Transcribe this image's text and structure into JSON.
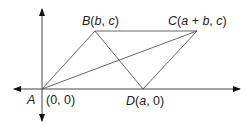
{
  "diagram": {
    "type": "coordinate-geometry",
    "points": {
      "A": {
        "name": "A",
        "coords": "(0, 0)"
      },
      "B": {
        "name": "B",
        "coords": "(b, c)"
      },
      "C": {
        "name": "C",
        "coords": "(a + b, c)"
      },
      "D": {
        "name": "D",
        "coords": "(a, 0)"
      }
    },
    "labels": {
      "A_letter": "A",
      "A_coords": "(0, 0)",
      "B_letter": "B",
      "B_open": "(",
      "B_b": "b",
      "B_sep": ", ",
      "B_c": "c",
      "B_close": ")",
      "C_letter": "C",
      "C_open": "(",
      "C_a": "a",
      "C_plus": " + ",
      "C_b": "b",
      "C_sep": ", ",
      "C_c": "c",
      "C_close": ")",
      "D_letter": "D",
      "D_open": "(",
      "D_a": "a",
      "D_rest": ", 0)"
    },
    "edges": [
      "AB",
      "BC",
      "CD",
      "DA",
      "AC",
      "BD"
    ],
    "colors": {
      "line": "#333333",
      "text": "#222222"
    }
  }
}
